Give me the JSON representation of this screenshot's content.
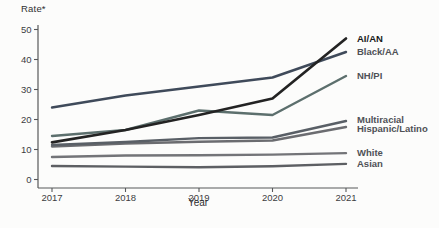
{
  "figure": {
    "background": "#fcfcfb",
    "axis_color": "#57585a",
    "tick_label_color": "#3c3d3f"
  },
  "chart_data": {
    "type": "line",
    "title": "",
    "ylabel": "Rate*",
    "xlabel": "Year",
    "x": [
      2017,
      2018,
      2019,
      2020,
      2021
    ],
    "xtick_labels": [
      "2017",
      "2018",
      "2019",
      "2020",
      "2021"
    ],
    "yticks": [
      0,
      10,
      20,
      30,
      40,
      50
    ],
    "ylim": [
      0,
      50
    ],
    "grid": false,
    "legend_position": "labels-at-line-ends-right",
    "series": [
      {
        "name": "AI/AN",
        "values": [
          12.4,
          16.5,
          21.5,
          27.0,
          47.0
        ],
        "color": "#232323",
        "label_color": "#191919",
        "emphasis": true
      },
      {
        "name": "Black/AA",
        "values": [
          24.0,
          28.0,
          31.0,
          34.0,
          42.5
        ],
        "color": "#3f4a5a",
        "label_color": "#4f5156",
        "emphasis": false
      },
      {
        "name": "NH/PI",
        "values": [
          14.5,
          16.5,
          23.0,
          21.5,
          34.5
        ],
        "color": "#5c6f6d",
        "label_color": "#4f5156",
        "emphasis": false
      },
      {
        "name": "Multiracial",
        "values": [
          11.5,
          12.5,
          13.8,
          14.0,
          19.5
        ],
        "color": "#595f66",
        "label_color": "#4f5156",
        "emphasis": false
      },
      {
        "name": "Hispanic/Latino",
        "values": [
          11.0,
          12.0,
          12.6,
          13.0,
          17.5
        ],
        "color": "#6b6c70",
        "label_color": "#4f5156",
        "emphasis": false
      },
      {
        "name": "White",
        "values": [
          7.5,
          8.0,
          8.1,
          8.3,
          8.8
        ],
        "color": "#737478",
        "label_color": "#4f5156",
        "emphasis": false
      },
      {
        "name": "Asian",
        "values": [
          4.5,
          4.3,
          4.1,
          4.4,
          5.2
        ],
        "color": "#5d5f63",
        "label_color": "#4f5156",
        "emphasis": false
      }
    ]
  }
}
